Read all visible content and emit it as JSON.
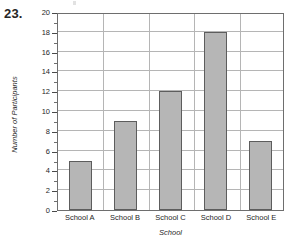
{
  "question": {
    "number": "23."
  },
  "chart_data": {
    "type": "bar",
    "title": "",
    "subtitle": "",
    "xlabel": "School",
    "ylabel": "Number of Participants",
    "categories": [
      "School A",
      "School B",
      "School C",
      "School D",
      "School E"
    ],
    "values": [
      5,
      9,
      12,
      18,
      7
    ],
    "series": [
      {
        "name": "Number of Participants",
        "values": [
          5,
          9,
          12,
          18,
          7
        ]
      }
    ],
    "ylim": [
      0,
      20
    ],
    "ytick_step": 2,
    "yticks": [
      0,
      2,
      4,
      6,
      8,
      10,
      12,
      14,
      16,
      18,
      20
    ],
    "ytick_labels": [
      "0",
      "2",
      "4",
      "6",
      "8",
      "10",
      "12",
      "14",
      "16",
      "18",
      "20"
    ],
    "minor_ytick_step": 1,
    "grid": true,
    "grid_axes": "both",
    "legend": false,
    "legend_position": "none",
    "bar_fill_color": "#b6b6b6",
    "bar_border_color": "#5d5d5d",
    "grid_color": "#b5b5b5",
    "axis_color": "#6e6e6e",
    "background_color": "#ffffff",
    "annotations": []
  }
}
